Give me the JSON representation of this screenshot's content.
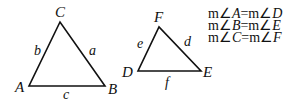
{
  "triangles": [
    {
      "name": "ABC",
      "vertices": {
        "A": [
          29,
          86
        ],
        "B": [
          105,
          86
        ],
        "C": [
          60,
          22
        ]
      },
      "vertex_labels": {
        "A": "A",
        "B": "B",
        "C": "C"
      },
      "side_labels": {
        "a": "a",
        "b": "b",
        "c": "c"
      }
    },
    {
      "name": "DEF",
      "vertices": {
        "D": [
          138,
          71
        ],
        "E": [
          201,
          71
        ],
        "F": [
          159,
          27
        ]
      },
      "vertex_labels": {
        "D": "D",
        "E": "E",
        "F": "F"
      },
      "side_labels": {
        "d": "d",
        "e": "e",
        "f": "f"
      }
    }
  ],
  "equations": [
    {
      "left_prefix": "m∠",
      "left_var": "A",
      "equals": "=",
      "right_prefix": "m∠",
      "right_var": "D"
    },
    {
      "left_prefix": "m∠",
      "left_var": "B",
      "equals": "=",
      "right_prefix": "m∠",
      "right_var": "E"
    },
    {
      "left_prefix": "m∠",
      "left_var": "C",
      "equals": "=",
      "right_prefix": "m∠",
      "right_var": "F"
    }
  ],
  "colors": {
    "stroke": "#111111",
    "background": "#ffffff"
  }
}
